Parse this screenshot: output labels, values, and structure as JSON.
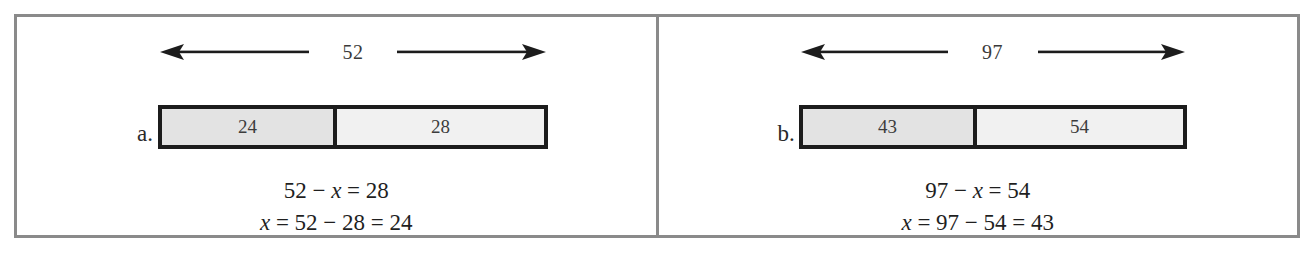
{
  "figure": {
    "type": "bar-model-diagram",
    "border_color": "#8a8a8a",
    "bar_border_color": "#1c1c1c",
    "left_segment_fill": "#e3e3e3",
    "right_segment_fill": "#f1f1f1",
    "panels": [
      {
        "letter": "a.",
        "total_label": "52",
        "left_arrow_icon": "left-arrow-icon",
        "right_arrow_icon": "right-arrow-icon",
        "segments": [
          {
            "value": "24",
            "shaded": true
          },
          {
            "value": "28",
            "shaded": false
          }
        ],
        "equations": [
          "52 − x = 28",
          "x = 52 − 28 = 24"
        ],
        "equation_parts": [
          {
            "pre": "52 − ",
            "var": "x",
            "post": " = 28"
          },
          {
            "pre": "",
            "var": "x",
            "post": " = 52 − 28 = 24"
          }
        ]
      },
      {
        "letter": "b.",
        "total_label": "97",
        "left_arrow_icon": "left-arrow-icon",
        "right_arrow_icon": "right-arrow-icon",
        "segments": [
          {
            "value": "43",
            "shaded": true
          },
          {
            "value": "54",
            "shaded": false
          }
        ],
        "equations": [
          "97 − x = 54",
          "x = 97 − 54 = 43"
        ],
        "equation_parts": [
          {
            "pre": "97 − ",
            "var": "x",
            "post": " = 54"
          },
          {
            "pre": "",
            "var": "x",
            "post": " = 97 − 54 = 43"
          }
        ]
      }
    ]
  },
  "chart_data": {
    "type": "bar",
    "title": "",
    "xlabel": "",
    "ylabel": "",
    "charts": [
      {
        "label": "a.",
        "total": 52,
        "categories": [
          "24",
          "28"
        ],
        "values": [
          24,
          28
        ],
        "annotation": "52 − x = 28 ; x = 52 − 28 = 24"
      },
      {
        "label": "b.",
        "total": 97,
        "categories": [
          "43",
          "54"
        ],
        "values": [
          43,
          54
        ],
        "annotation": "97 − x = 54 ; x = 97 − 54 = 43"
      }
    ]
  }
}
